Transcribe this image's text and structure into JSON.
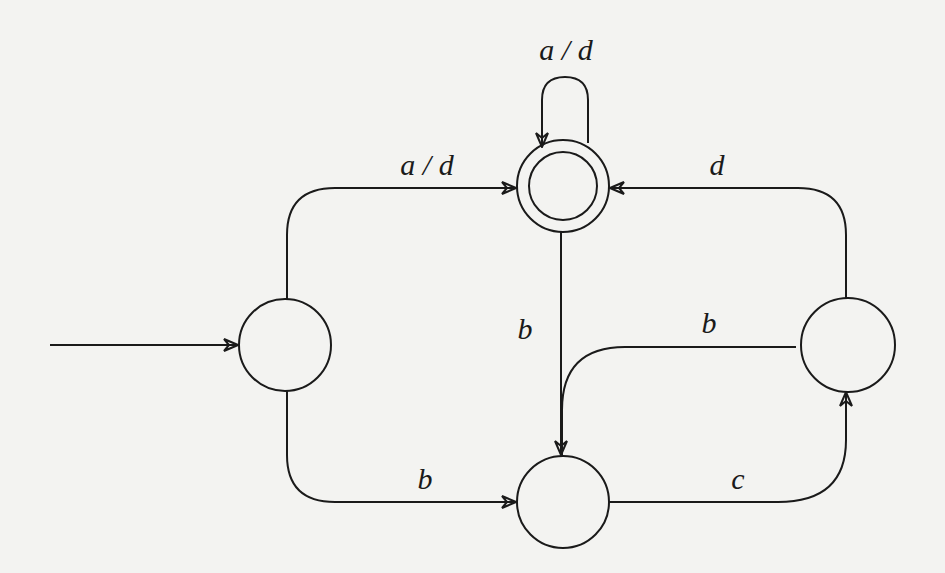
{
  "diagram": {
    "type": "finite-state-automaton",
    "colors": {
      "stroke": "#1a1a1a",
      "background": "#f3f3f1"
    },
    "states": [
      {
        "id": "q0",
        "role": "start",
        "accepting": false,
        "cx": 285,
        "cy": 345,
        "r": 46
      },
      {
        "id": "q1",
        "role": "accepting",
        "accepting": true,
        "cx": 563,
        "cy": 186,
        "r": 46,
        "inner_r": 34
      },
      {
        "id": "q2",
        "role": "normal",
        "accepting": false,
        "cx": 563,
        "cy": 502,
        "r": 46
      },
      {
        "id": "q3",
        "role": "normal",
        "accepting": false,
        "cx": 848,
        "cy": 345,
        "r": 47
      }
    ],
    "edges": [
      {
        "id": "start",
        "from": null,
        "to": "q0",
        "label": ""
      },
      {
        "id": "q0-q1",
        "from": "q0",
        "to": "q1",
        "label": "a / d"
      },
      {
        "id": "q1-q1",
        "from": "q1",
        "to": "q1",
        "label": "a / d"
      },
      {
        "id": "q0-q2",
        "from": "q0",
        "to": "q2",
        "label": "b"
      },
      {
        "id": "q1-q2",
        "from": "q1",
        "to": "q2",
        "label": "b"
      },
      {
        "id": "q3-q2",
        "from": "q3",
        "to": "q2",
        "label": "b"
      },
      {
        "id": "q2-q3",
        "from": "q2",
        "to": "q3",
        "label": "c"
      },
      {
        "id": "q3-q1",
        "from": "q3",
        "to": "q1",
        "label": "d"
      }
    ]
  },
  "labels": {
    "self_loop": "a / d",
    "q0_to_q1": "a / d",
    "q3_to_q1": "d",
    "q1_to_q2": "b",
    "q3_to_q2": "b",
    "q0_to_q2": "b",
    "q2_to_q3": "c"
  }
}
